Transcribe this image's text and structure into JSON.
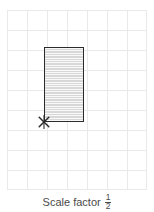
{
  "figure": {
    "grid": {
      "cell_size_px": 20,
      "columns": 7,
      "rows": 9,
      "line_color": "#e9e9ec",
      "visible": true
    },
    "shape": {
      "type": "rectangle",
      "label": "shaded rectangle",
      "width_cells": 2,
      "height_cells": 3.75,
      "fill_color": "#d8d8d8",
      "stroke_color": "#2b2b2b",
      "hatching": "horizontal-lines"
    },
    "centre_of_enlargement": {
      "marker": "cross-marker",
      "label": "x",
      "position": "bottom-left corner of rectangle",
      "color": "#2b2b2b"
    }
  },
  "caption": {
    "label": "Scale factor",
    "scale_factor": {
      "numerator": "1",
      "denominator": "2",
      "display": "1/2"
    },
    "text_color": "#4a4a4a"
  }
}
